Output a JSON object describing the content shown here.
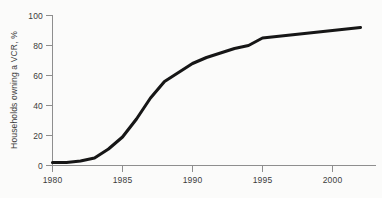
{
  "chart_data": {
    "type": "line",
    "title": "",
    "subtitle": "",
    "xlabel": "",
    "ylabel": "Households owning a VCR, %",
    "xlim": [
      1980,
      2002
    ],
    "ylim": [
      0,
      100
    ],
    "grid": false,
    "legend": null,
    "xticks": [
      1980,
      1985,
      1990,
      1995,
      2000
    ],
    "xtick_labels": [
      "1980",
      "1985",
      "1990",
      "1995",
      "2000"
    ],
    "yticks": [
      0,
      20,
      40,
      60,
      80,
      100
    ],
    "ytick_labels": [
      "0",
      "20",
      "40",
      "60",
      "80",
      "100"
    ],
    "line_color": "#161616",
    "background_color": "#fbfbfa",
    "axis_color": "#8e8e8e",
    "series": [
      {
        "name": "Households owning a VCR",
        "x": [
          1980,
          1981,
          1982,
          1983,
          1984,
          1985,
          1986,
          1987,
          1988,
          1989,
          1990,
          1991,
          1992,
          1993,
          1994,
          1995,
          1996,
          1997,
          1998,
          1999,
          2000,
          2001,
          2002
        ],
        "values": [
          2,
          2,
          3,
          5,
          11,
          19,
          31,
          45,
          56,
          62,
          68,
          72,
          75,
          78,
          80,
          85,
          86,
          87,
          88,
          89,
          90,
          91,
          92
        ]
      }
    ]
  },
  "axes": {
    "y_axis_title": "Households owning a VCR, %"
  }
}
